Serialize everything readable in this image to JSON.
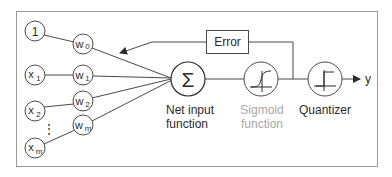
{
  "diagram": {
    "colors": {
      "stroke": "#4a4a4a",
      "frame": "#9a9a9a",
      "text": "#2b2b2b",
      "muted_text": "#a8a8a8"
    },
    "inputs": [
      {
        "label": "1",
        "sub": ""
      },
      {
        "label": "x",
        "sub": "1"
      },
      {
        "label": "x",
        "sub": "2"
      },
      {
        "label": "x",
        "sub": "m"
      }
    ],
    "weights": [
      {
        "label": "w",
        "sub": "0"
      },
      {
        "label": "w",
        "sub": "1"
      },
      {
        "label": "w",
        "sub": "2"
      },
      {
        "label": "w",
        "sub": "m"
      }
    ],
    "ellipsis": "⋮",
    "net_input": {
      "symbol": "Σ",
      "label_line1": "Net input",
      "label_line2": "function"
    },
    "sigmoid": {
      "label_line1": "Sigmoid",
      "label_line2": "function"
    },
    "quantizer": {
      "label": "Quantizer"
    },
    "error_box": {
      "label": "Error"
    },
    "output": {
      "label": "y"
    }
  }
}
